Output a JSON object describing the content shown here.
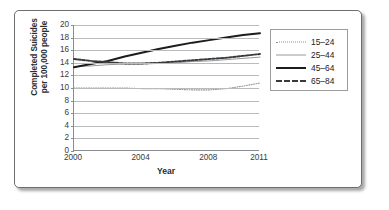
{
  "chart_data": {
    "type": "line",
    "title": "",
    "xlabel": "Year",
    "ylabel": "Completed Suicides per 100,000 people",
    "ylabel_line1": "Completed Suicides",
    "ylabel_line2": "per 100,000 people",
    "ylim": [
      0,
      20
    ],
    "ytick_labels": [
      "0",
      "2",
      "4",
      "6",
      "8",
      "10",
      "12",
      "14",
      "16",
      "18",
      "20"
    ],
    "ytick_values": [
      0,
      2,
      4,
      6,
      8,
      10,
      12,
      14,
      16,
      18,
      20
    ],
    "xlim": [
      2000,
      2011
    ],
    "xtick_labels": [
      "2000",
      "2004",
      "2008",
      "2011"
    ],
    "xtick_values": [
      2000,
      2004,
      2008,
      2011
    ],
    "grid": "horizontal",
    "legend_position": "right-outside",
    "x": [
      2000,
      2001,
      2002,
      2003,
      2004,
      2005,
      2006,
      2007,
      2008,
      2009,
      2010,
      2011
    ],
    "series": [
      {
        "name": "15–24",
        "style": "fine-dotted",
        "color": "#8f9295",
        "values": [
          10.0,
          10.0,
          10.0,
          10.0,
          9.9,
          9.9,
          9.8,
          9.7,
          9.7,
          9.9,
          10.3,
          10.8
        ]
      },
      {
        "name": "25–44",
        "style": "thin-solid",
        "color": "#97999c",
        "values": [
          13.4,
          13.5,
          13.7,
          13.8,
          13.8,
          13.9,
          14.0,
          14.2,
          14.3,
          14.5,
          14.7,
          14.9
        ]
      },
      {
        "name": "45–64",
        "style": "thick-solid",
        "color": "#1c1c1c",
        "values": [
          13.3,
          13.8,
          14.3,
          15.0,
          15.6,
          16.2,
          16.7,
          17.2,
          17.6,
          18.0,
          18.4,
          18.7
        ]
      },
      {
        "name": "65–84",
        "style": "bold-dashed",
        "color": "#3a3a3a",
        "values": [
          14.6,
          14.3,
          14.1,
          13.9,
          13.9,
          14.0,
          14.2,
          14.4,
          14.6,
          14.8,
          15.1,
          15.4
        ]
      }
    ]
  },
  "legend": {
    "items": [
      {
        "label": "15–24"
      },
      {
        "label": "25–44"
      },
      {
        "label": "45–64"
      },
      {
        "label": "65–84"
      }
    ]
  }
}
